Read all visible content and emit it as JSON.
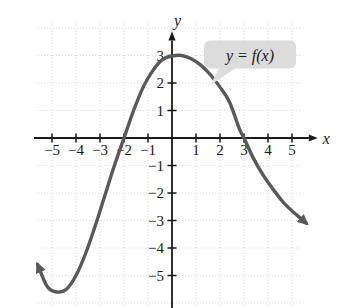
{
  "figure": {
    "title": "",
    "curve_label": "y = f(x)",
    "x_axis_name": "x",
    "y_axis_name": "y"
  },
  "colors": {
    "curve": "#595959",
    "axis": "#1a1a1a",
    "grid": "#d9d9d9",
    "label_bubble_bg": "#dcdcdc",
    "label_text": "#1a1a1a",
    "background": "#ffffff"
  },
  "chart_data": {
    "type": "line",
    "title": "",
    "subtitle": "",
    "xlabel": "x",
    "ylabel": "y",
    "xlim": [
      -6,
      6
    ],
    "ylim": [
      -6,
      4
    ],
    "grid": true,
    "legend": "none",
    "annotations": [
      {
        "text": "y = f(x)",
        "x": 2.5,
        "y": 3.0,
        "style": "callout-bubble"
      }
    ],
    "x_ticks": [
      -5,
      -4,
      -3,
      -2,
      -1,
      1,
      2,
      3,
      4,
      5
    ],
    "x_tick_labels": [
      "−5",
      "−4",
      "−3",
      "−2",
      "−1",
      "1",
      "2",
      "3",
      "4",
      "5"
    ],
    "y_ticks": [
      3,
      2,
      1,
      -1,
      -2,
      -3,
      -4,
      -5
    ],
    "y_tick_labels": [
      "3",
      "2",
      "1",
      "−1",
      "−2",
      "−3",
      "−4",
      "−5"
    ],
    "series": [
      {
        "name": "f(x)",
        "x": [
          -5.6,
          -5.2,
          -4.8,
          -4.4,
          -4.0,
          -3.6,
          -3.2,
          -2.8,
          -2.4,
          -2.0,
          -1.6,
          -1.2,
          -0.8,
          -0.4,
          0.0,
          0.4,
          0.8,
          1.2,
          1.6,
          2.0,
          2.4,
          2.8,
          3.0,
          3.4,
          3.8,
          4.2,
          4.6,
          5.0,
          5.4,
          5.6
        ],
        "y": [
          -4.6,
          -5.4,
          -5.6,
          -5.5,
          -5.0,
          -4.2,
          -3.2,
          -2.1,
          -1.0,
          0.0,
          1.0,
          1.85,
          2.45,
          2.85,
          2.98,
          3.0,
          2.88,
          2.65,
          2.3,
          1.85,
          1.3,
          0.35,
          0.0,
          -0.75,
          -1.35,
          -1.85,
          -2.3,
          -2.65,
          -2.95,
          -3.1
        ],
        "arrow_start": true,
        "arrow_end": true
      }
    ],
    "x_intercepts": [
      -2,
      3
    ],
    "y_intercept": 2.98,
    "local_max": {
      "x": 0.4,
      "y": 3.0
    },
    "local_min": {
      "x": -4.7,
      "y": -5.6
    }
  }
}
